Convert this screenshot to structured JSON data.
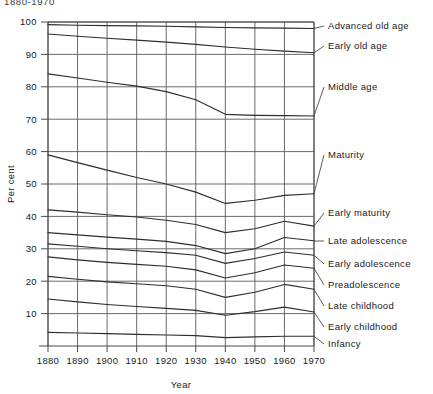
{
  "figure": {
    "top_note": "1880-1970"
  },
  "chart_data": {
    "type": "line",
    "title": "",
    "subtitle": "",
    "xlabel": "Year",
    "ylabel": "Per cent",
    "grid": true,
    "legend_position": "right-of-axes-inline-labels",
    "x": [
      1880,
      1890,
      1900,
      1910,
      1920,
      1930,
      1940,
      1950,
      1960,
      1970
    ],
    "xlim": [
      1880,
      1970
    ],
    "ylim": [
      0,
      100
    ],
    "xtick_labels": [
      "1880",
      "1890",
      "1900",
      "1910",
      "1920",
      "1930",
      "1940",
      "1950",
      "1960",
      "1970"
    ],
    "ytick_labels": [
      "10",
      "20",
      "30",
      "40",
      "50",
      "60",
      "70",
      "80",
      "90",
      "100"
    ],
    "ytick_values": [
      10,
      20,
      30,
      40,
      50,
      60,
      70,
      80,
      90,
      100
    ],
    "series": [
      {
        "name": "Advanced old age",
        "label": "Advanced old age",
        "values": [
          99.2,
          99.0,
          98.9,
          98.8,
          98.7,
          98.5,
          98.3,
          98.2,
          98.1,
          98.0
        ]
      },
      {
        "name": "Early old age",
        "label": "Early old age",
        "values": [
          96.3,
          95.6,
          95.0,
          94.4,
          93.8,
          93.1,
          92.3,
          91.6,
          91.0,
          90.5
        ]
      },
      {
        "name": "Middle age",
        "label": "Middle age",
        "values": [
          84.0,
          82.7,
          81.4,
          80.2,
          78.5,
          76.0,
          71.5,
          71.2,
          71.1,
          71.0
        ]
      },
      {
        "name": "Maturity",
        "label": "Maturity",
        "values": [
          59.0,
          56.6,
          54.3,
          52.0,
          50.0,
          47.5,
          44.0,
          45.0,
          46.5,
          47.0
        ]
      },
      {
        "name": "Early maturity",
        "label": "Early maturity",
        "values": [
          42.0,
          41.3,
          40.5,
          39.8,
          38.8,
          37.5,
          35.0,
          36.2,
          38.5,
          37.0
        ]
      },
      {
        "name": "Late adolescence",
        "label": "Late adolescence",
        "values": [
          35.0,
          34.3,
          33.6,
          33.0,
          32.3,
          31.0,
          28.5,
          30.0,
          33.5,
          32.5
        ]
      },
      {
        "name": "Early adolescence",
        "label": "Early adolescence",
        "values": [
          31.5,
          30.8,
          30.0,
          29.4,
          28.8,
          28.0,
          25.5,
          27.0,
          29.0,
          28.0
        ]
      },
      {
        "name": "Preadolescence",
        "label": "Preadolescence",
        "values": [
          27.5,
          26.6,
          25.8,
          25.2,
          24.6,
          23.5,
          21.0,
          22.6,
          25.0,
          24.0
        ]
      },
      {
        "name": "Late childhood",
        "label": "Late childhood",
        "values": [
          21.5,
          20.6,
          19.8,
          19.2,
          18.6,
          17.5,
          15.0,
          16.6,
          19.0,
          17.5
        ]
      },
      {
        "name": "Early childhood",
        "label": "Early childhood",
        "values": [
          14.5,
          13.6,
          12.8,
          12.2,
          11.6,
          11.0,
          9.5,
          10.6,
          12.0,
          10.5
        ]
      },
      {
        "name": "Infancy",
        "label": "Infancy",
        "values": [
          4.2,
          4.0,
          3.8,
          3.6,
          3.4,
          3.2,
          2.6,
          2.8,
          3.0,
          3.0
        ]
      }
    ]
  }
}
